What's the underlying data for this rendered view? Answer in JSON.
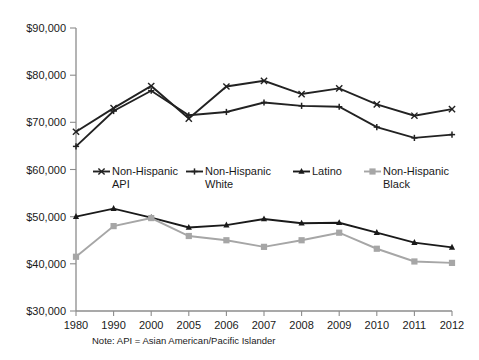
{
  "chart_data": {
    "type": "line",
    "title": "",
    "xlabel": "",
    "ylabel": "",
    "categories": [
      "1980",
      "1990",
      "2000",
      "2005",
      "2006",
      "2007",
      "2008",
      "2009",
      "2010",
      "2011",
      "2012"
    ],
    "ylim": [
      30000,
      90000
    ],
    "ytick_values": [
      30000,
      40000,
      50000,
      60000,
      70000,
      80000,
      90000
    ],
    "ytick_labels": [
      "$30,000",
      "$40,000",
      "$50,000",
      "$60,000",
      "$70,000",
      "$80,000",
      "$90,000"
    ],
    "grid": false,
    "legend_position": "middle-center",
    "series": [
      {
        "name": "Non-Hispanic API",
        "color": "#222222",
        "marker": "x",
        "values": [
          68000,
          73000,
          77700,
          70800,
          77600,
          78800,
          76000,
          77200,
          73800,
          71400,
          72800
        ]
      },
      {
        "name": "Non-Hispanic White",
        "color": "#222222",
        "marker": "plus",
        "values": [
          64900,
          72400,
          76700,
          71500,
          72200,
          74200,
          73500,
          73300,
          69000,
          66700,
          67400
        ]
      },
      {
        "name": "Latino",
        "color": "#1a1a1a",
        "marker": "triangle",
        "values": [
          50000,
          51700,
          49800,
          47700,
          48200,
          49500,
          48600,
          48700,
          46600,
          44500,
          43500
        ]
      },
      {
        "name": "Non-Hispanic Black",
        "color": "#a6a6a6",
        "marker": "square",
        "values": [
          41500,
          48000,
          49700,
          45900,
          45000,
          43600,
          45000,
          46600,
          43200,
          40500,
          40200
        ]
      }
    ]
  },
  "legend": {
    "entries": [
      {
        "label_line1": "Non-Hispanic",
        "label_line2": "API"
      },
      {
        "label_line1": "Non-Hispanic",
        "label_line2": "White"
      },
      {
        "label_line1": "Latino",
        "label_line2": ""
      },
      {
        "label_line1": "Non-Hispanic",
        "label_line2": "Black"
      }
    ]
  },
  "footnote": {
    "text": "Note: API = Asian American/Pacific Islander"
  }
}
